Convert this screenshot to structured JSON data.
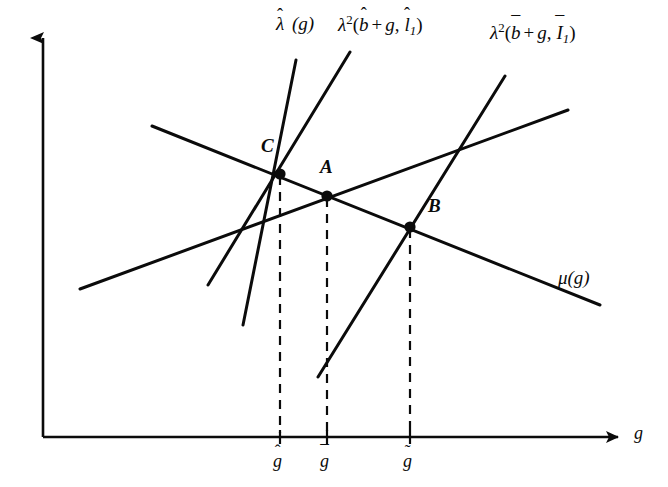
{
  "figure": {
    "type": "line-diagram",
    "background": "#ffffff",
    "ink": "#0b0b0b",
    "width": 668,
    "height": 487
  },
  "axes": {
    "x_label": "g",
    "y_label": "",
    "origin": [
      43,
      437
    ],
    "x_end": [
      625,
      437
    ],
    "y_end": [
      43,
      25
    ],
    "arrowheads": [
      "x",
      "y"
    ]
  },
  "curves": [
    {
      "id": "lambda-hat",
      "label_plain": "λ̂ (g)",
      "label_head": "λ",
      "label_accent": "hat",
      "label_arg": "(g)",
      "from": [
        243,
        325
      ],
      "to": [
        296,
        60
      ],
      "label_pos": [
        276,
        22
      ]
    },
    {
      "id": "lambda2-hat",
      "label_plain": "λ²(b̂ + g, î₁)",
      "label_head": "λ",
      "label_exponent": "2",
      "label_args": [
        "b̂",
        "+",
        "g,",
        "î₁"
      ],
      "from": [
        208,
        285
      ],
      "to": [
        350,
        52
      ],
      "label_pos": [
        340,
        22
      ]
    },
    {
      "id": "lambda2-bar",
      "label_plain": "λ²(b̄ + g, Ī₁)",
      "label_head": "λ",
      "label_exponent": "2",
      "label_args": [
        "b̄",
        "+",
        "g,",
        "Ī₁"
      ],
      "from": [
        318,
        377
      ],
      "to": [
        505,
        76
      ],
      "label_pos": [
        492,
        30
      ]
    },
    {
      "id": "mu",
      "label_plain": "μ(g)",
      "label_head": "μ",
      "label_arg": "(g)",
      "from": [
        152,
        126
      ],
      "to": [
        600,
        305
      ],
      "label_pos": [
        560,
        272
      ]
    },
    {
      "id": "upward-shallow",
      "label_plain": "",
      "from": [
        80,
        289
      ],
      "to": [
        568,
        110
      ],
      "label_pos": null
    }
  ],
  "points": [
    {
      "id": "C",
      "label": "C",
      "at": [
        280,
        174
      ],
      "label_pos": [
        261,
        143
      ],
      "tick": "g-hat"
    },
    {
      "id": "A",
      "label": "A",
      "at": [
        327,
        196
      ],
      "label_pos": [
        322,
        163
      ],
      "tick": "g-bar"
    },
    {
      "id": "B",
      "label": "B",
      "at": [
        410,
        227
      ],
      "label_pos": [
        427,
        202
      ],
      "tick": "g-tilde"
    }
  ],
  "drop_lines": [
    {
      "from": [
        280,
        174
      ],
      "to": [
        280,
        437
      ],
      "style": "dashed"
    },
    {
      "from": [
        327,
        196
      ],
      "to": [
        327,
        437
      ],
      "style": "dashed"
    },
    {
      "from": [
        410,
        227
      ],
      "to": [
        410,
        437
      ],
      "style": "dashed"
    }
  ],
  "ticks": [
    {
      "id": "g-hat",
      "x": 280,
      "label_plain": "ĝ",
      "base": "g",
      "accent": "ˆ",
      "label_pos": [
        272,
        447
      ]
    },
    {
      "id": "g-bar",
      "x": 327,
      "label_plain": "ḡ",
      "base": "g",
      "accent": "¯",
      "label_pos": [
        319,
        447
      ]
    },
    {
      "id": "g-tilde",
      "x": 410,
      "label_plain": "g̃",
      "base": "g",
      "accent": "˜",
      "label_pos": [
        402,
        447
      ]
    }
  ],
  "accents": {
    "hat": "ˆ",
    "bar": "¯",
    "tilde": "˜"
  },
  "text": {
    "plus": "+",
    "comma": ",",
    "paren_open": "(",
    "paren_close": ")",
    "subscript_one": "1",
    "exponent_two": "2",
    "g": "g",
    "b": "b",
    "I": "I",
    "lambda": "λ",
    "mu": "μ"
  }
}
